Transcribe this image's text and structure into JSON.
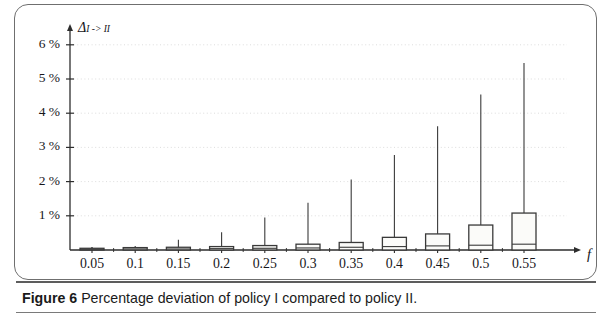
{
  "figure": {
    "caption_label": "Figure 6",
    "caption_text": " Percentage deviation of policy I compared to policy II.",
    "full_caption": "Figure 6 Percentage deviation of policy I compared to policy II."
  },
  "chart_data": {
    "type": "box",
    "title": "",
    "subtitle": "",
    "xlabel": "f",
    "ylabel": "Δ",
    "ylabel_sub": "I -> II",
    "ylabel_full": "Δ I -> II",
    "categories": [
      "0.05",
      "0.1",
      "0.15",
      "0.2",
      "0.25",
      "0.3",
      "0.35",
      "0.4",
      "0.45",
      "0.5",
      "0.55"
    ],
    "x": [
      0.05,
      0.1,
      0.15,
      0.2,
      0.25,
      0.3,
      0.35,
      0.4,
      0.45,
      0.5,
      0.55
    ],
    "ytick_labels": [
      "1 %",
      "2 %",
      "3 %",
      "4 %",
      "5 %",
      "6 %"
    ],
    "ytick_values": [
      1,
      2,
      3,
      4,
      5,
      6
    ],
    "ylim": [
      0,
      6.6
    ],
    "yunit": "%",
    "grid": true,
    "grid_axis": "y",
    "legend": "none",
    "axis_arrows": true,
    "series": [
      {
        "name": "Δ I -> II",
        "boxes": [
          {
            "category": "0.05",
            "q1": 0.0,
            "median": 0.02,
            "q3": 0.05,
            "whisker_low": 0.0,
            "whisker_high": 0.07
          },
          {
            "category": "0.1",
            "q1": 0.0,
            "median": 0.03,
            "q3": 0.07,
            "whisker_low": 0.0,
            "whisker_high": 0.12
          },
          {
            "category": "0.15",
            "q1": 0.0,
            "median": 0.03,
            "q3": 0.08,
            "whisker_low": 0.0,
            "whisker_high": 0.3
          },
          {
            "category": "0.2",
            "q1": 0.0,
            "median": 0.04,
            "q3": 0.1,
            "whisker_low": 0.0,
            "whisker_high": 0.52
          },
          {
            "category": "0.25",
            "q1": 0.0,
            "median": 0.05,
            "q3": 0.13,
            "whisker_low": 0.0,
            "whisker_high": 0.95
          },
          {
            "category": "0.3",
            "q1": 0.0,
            "median": 0.06,
            "q3": 0.17,
            "whisker_low": 0.0,
            "whisker_high": 1.38
          },
          {
            "category": "0.35",
            "q1": 0.0,
            "median": 0.08,
            "q3": 0.22,
            "whisker_low": 0.0,
            "whisker_high": 2.06
          },
          {
            "category": "0.4",
            "q1": 0.0,
            "median": 0.1,
            "q3": 0.37,
            "whisker_low": 0.0,
            "whisker_high": 2.78
          },
          {
            "category": "0.45",
            "q1": 0.0,
            "median": 0.12,
            "q3": 0.47,
            "whisker_low": 0.0,
            "whisker_high": 3.62
          },
          {
            "category": "0.5",
            "q1": 0.0,
            "median": 0.14,
            "q3": 0.73,
            "whisker_low": 0.0,
            "whisker_high": 4.55
          },
          {
            "category": "0.55",
            "q1": 0.0,
            "median": 0.17,
            "q3": 1.08,
            "whisker_low": 0.0,
            "whisker_high": 5.47
          }
        ]
      }
    ],
    "colors": {
      "box_fill": "#fbfbf9",
      "box_stroke": "#3a3a3a",
      "whisker": "#3a3a3a",
      "axis": "#2d2d2d",
      "grid": "#d9d9d9",
      "frame": "#6f6f6f",
      "text": "#16161a"
    }
  }
}
